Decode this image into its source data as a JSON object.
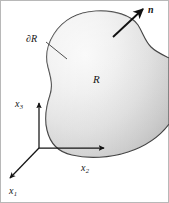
{
  "figure": {
    "background_color": "#ffffff",
    "width": 169,
    "height": 203
  },
  "labels": {
    "normal": "n",
    "region": "R",
    "boundary_partial": "∂",
    "boundary_letter": "R",
    "axis_x3_base": "x",
    "axis_x3_sub": "3",
    "axis_x2_base": "x",
    "axis_x2_sub": "2",
    "axis_x1_base": "x",
    "axis_x1_sub": "1"
  },
  "colors": {
    "stroke": "#3d3d3d",
    "axis": "#141414",
    "text": "#141414",
    "fill_light": "#f6f6f6",
    "fill_mid": "#dcdcdc",
    "fill_dark": "#c2c2c2",
    "frame": "#b5b5b5"
  },
  "geometry": {
    "origin": {
      "x": 39,
      "y": 148
    },
    "x3_axis_tip": {
      "x": 39,
      "y": 101
    },
    "x2_axis_tip": {
      "x": 106,
      "y": 148
    },
    "x1_axis_tip": {
      "x": 8,
      "y": 180
    },
    "normal_arrow_tail": {
      "x": 114,
      "y": 36
    },
    "normal_arrow_tip": {
      "x": 144,
      "y": 8
    },
    "leader_start": {
      "x": 46,
      "y": 42
    },
    "leader_end": {
      "x": 66,
      "y": 58
    }
  }
}
